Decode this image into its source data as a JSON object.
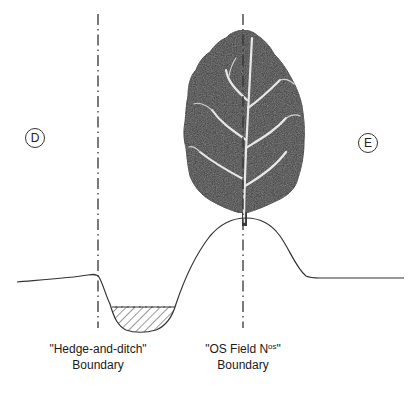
{
  "diagram": {
    "markers": [
      {
        "id": "D",
        "label": "D"
      },
      {
        "id": "E",
        "label": "E"
      }
    ],
    "boundaries": [
      {
        "name": "hedge-and-ditch",
        "line1": "\"Hedge-and-ditch\"",
        "line2": "Boundary"
      },
      {
        "name": "os-field",
        "line1_main": "\"OS Field N",
        "line1_sup": "os",
        "line1_end": "\"",
        "line2": "Boundary"
      }
    ],
    "elements": [
      "ground-profile",
      "ditch-with-water",
      "bank",
      "tree-leaf-silhouette",
      "dash-dot-boundary-lines"
    ],
    "colors": {
      "line": "#333333",
      "tree_fill": "#3a3a3a",
      "tree_veins": "#e8e8e8",
      "background": "#ffffff"
    }
  }
}
